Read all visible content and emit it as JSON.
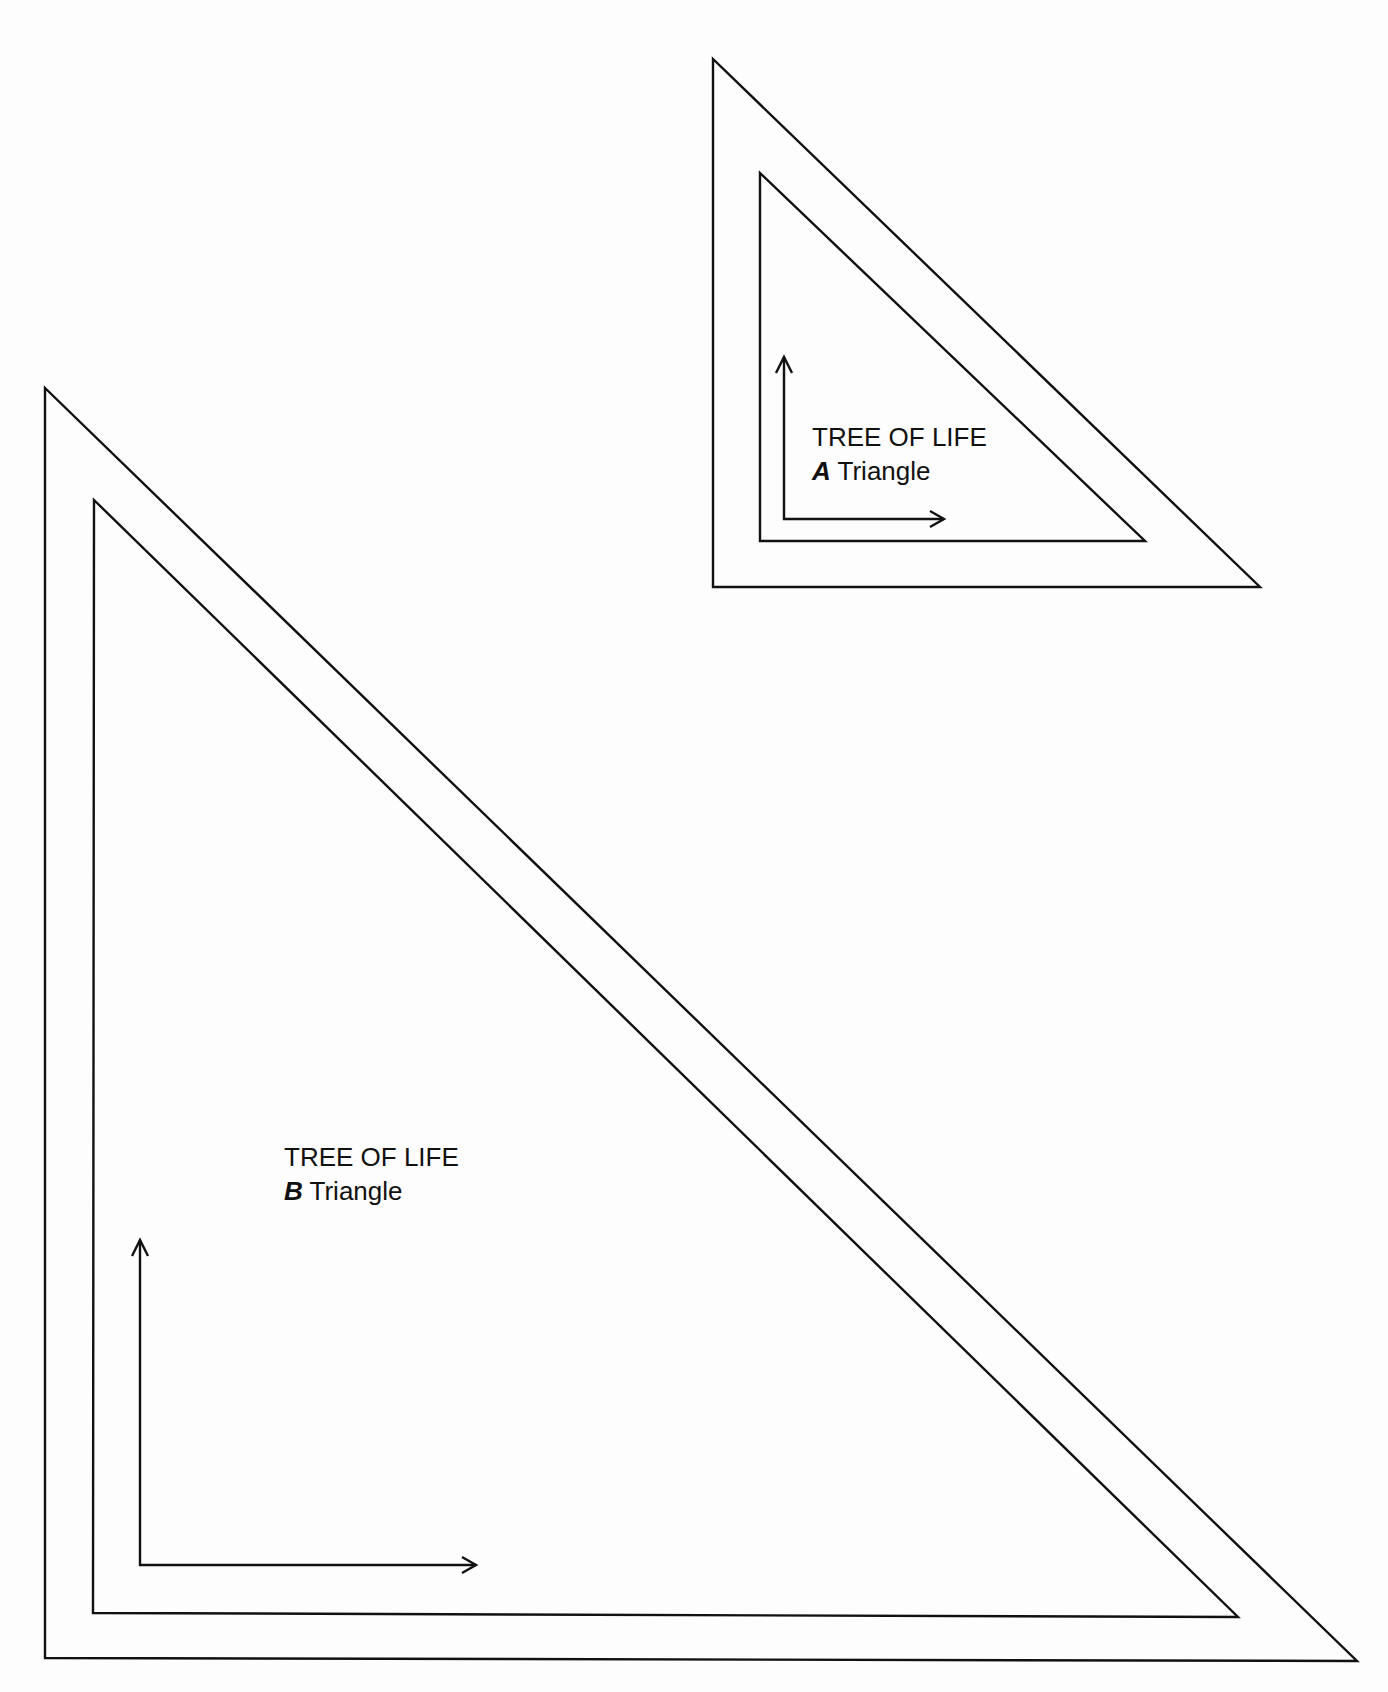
{
  "triangles": [
    {
      "id": "A",
      "title": "TREE OF LIFE",
      "letter": "A",
      "suffix": "Triangle",
      "outer": [
        [
          713,
          59
        ],
        [
          713,
          587
        ],
        [
          1260,
          587
        ]
      ],
      "inner": [
        [
          760,
          173
        ],
        [
          760,
          541
        ],
        [
          1145,
          541
        ]
      ],
      "arrow_corner": [
        784,
        519
      ],
      "arrow_up_tip": [
        784,
        357
      ],
      "arrow_right_tip": [
        944,
        519
      ]
    },
    {
      "id": "B",
      "title": "TREE OF LIFE",
      "letter": "B",
      "suffix": "Triangle",
      "outer": [
        [
          45,
          388
        ],
        [
          45,
          1658
        ],
        [
          1357,
          1661
        ]
      ],
      "inner": [
        [
          94,
          500
        ],
        [
          93,
          1613
        ],
        [
          1238,
          1617
        ]
      ],
      "arrow_corner": [
        140,
        1565
      ],
      "arrow_up_tip": [
        140,
        1240
      ],
      "arrow_right_tip": [
        476,
        1565
      ]
    }
  ],
  "colors": {
    "line": "#111111",
    "background": "#fdfdfd"
  }
}
